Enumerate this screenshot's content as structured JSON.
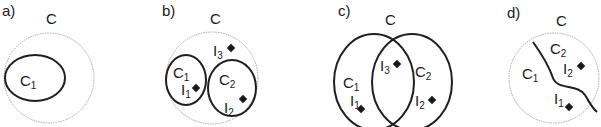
{
  "panels": [
    {
      "id": "a",
      "label": "a)",
      "universe": "C",
      "sets": [
        {
          "name": "C",
          "sub": "1"
        }
      ],
      "items": []
    },
    {
      "id": "b",
      "label": "b)",
      "universe": "C",
      "sets": [
        {
          "name": "C",
          "sub": "1"
        },
        {
          "name": "C",
          "sub": "2"
        }
      ],
      "items": [
        {
          "name": "I",
          "sub": "1"
        },
        {
          "name": "I",
          "sub": "2"
        },
        {
          "name": "I",
          "sub": "3"
        }
      ]
    },
    {
      "id": "c",
      "label": "c)",
      "universe": "C",
      "sets": [
        {
          "name": "C",
          "sub": "1"
        },
        {
          "name": "C",
          "sub": "2"
        }
      ],
      "items": [
        {
          "name": "I",
          "sub": "1"
        },
        {
          "name": "I",
          "sub": "2"
        },
        {
          "name": "I",
          "sub": "3"
        }
      ]
    },
    {
      "id": "d",
      "label": "d)",
      "universe": "C",
      "sets": [
        {
          "name": "C",
          "sub": "1"
        },
        {
          "name": "C",
          "sub": "2"
        }
      ],
      "items": [
        {
          "name": "I",
          "sub": "1"
        },
        {
          "name": "I",
          "sub": "2"
        }
      ]
    }
  ],
  "colors": {
    "outer_stroke": "#a8a8a8",
    "set_stroke": "#1f1f1f",
    "item_fill": "#1a1a1a"
  }
}
